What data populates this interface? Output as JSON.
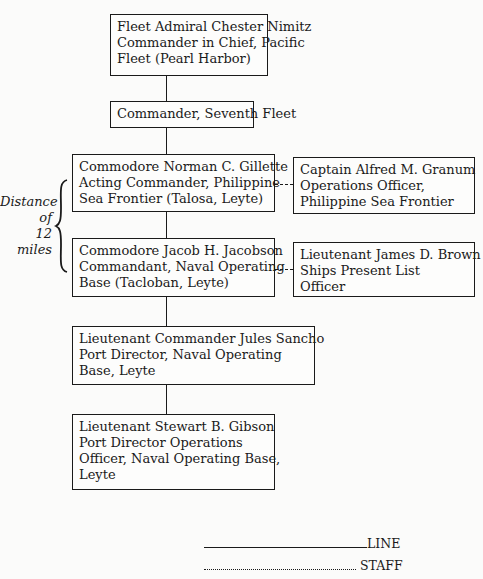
{
  "chart": {
    "line_boxes": [
      {
        "lines": [
          "Fleet Admiral Chester Nimitz",
          "Commander in Chief, Pacific",
          "Fleet (Pearl Harbor)"
        ]
      },
      {
        "lines": [
          "Commander, Seventh Fleet"
        ]
      },
      {
        "lines": [
          "Commodore Norman C. Gillette",
          "Acting Commander, Philippine",
          "Sea Frontier (Talosa, Leyte)"
        ]
      },
      {
        "lines": [
          "Commodore Jacob H. Jacobson",
          "Commandant, Naval Operating",
          "Base (Tacloban, Leyte)"
        ]
      },
      {
        "lines": [
          "Lieutenant Commander Jules Sancho",
          "Port Director, Naval Operating",
          "Base, Leyte"
        ]
      },
      {
        "lines": [
          "Lieutenant Stewart B. Gibson",
          "Port Director Operations",
          "Officer, Naval Operating Base,",
          "Leyte"
        ]
      }
    ],
    "staff_boxes": [
      {
        "lines": [
          "Captain Alfred M. Granum",
          "Operations Officer,",
          "Philippine Sea Frontier"
        ]
      },
      {
        "lines": [
          "Lieutenant James D. Brown",
          "Ships Present List",
          "Officer"
        ]
      }
    ],
    "distance_note": [
      "Distance",
      "of",
      "12",
      "miles"
    ]
  },
  "legend": {
    "line_label": "LINE",
    "staff_label": "STAFF"
  }
}
